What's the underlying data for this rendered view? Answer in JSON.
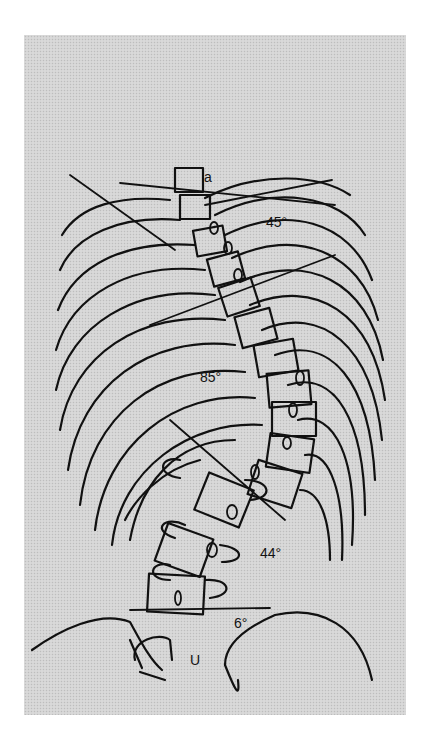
{
  "figure": {
    "type": "scoliosis radiograph tracing",
    "background_color": "#d4d4d4",
    "line_color": "#111111"
  },
  "angles": [
    {
      "label": "45°",
      "value": 45,
      "region": "upper thoracic"
    },
    {
      "label": "85°",
      "value": 85,
      "region": "thoracic"
    },
    {
      "label": "44°",
      "value": 44,
      "region": "lumbar"
    },
    {
      "label": "6°",
      "value": 6,
      "region": "lumbosacral"
    }
  ],
  "markings": {
    "upper_vertebra_letters": "a",
    "sacrum_letter": "U"
  }
}
